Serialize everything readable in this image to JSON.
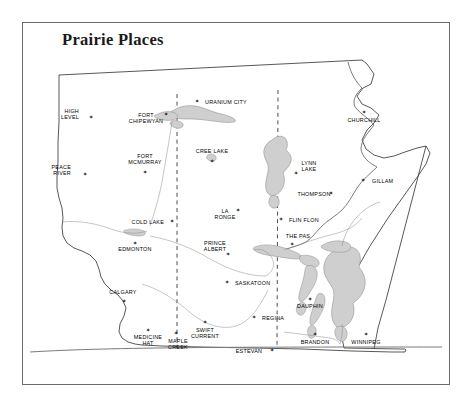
{
  "figure": {
    "title": "Prairie Places",
    "frame_color": "#6b6b6b",
    "background": "#ffffff",
    "land_fill": "#ffffff",
    "water_fill": "#cfcfcf",
    "water_stroke": "#8c8c8c",
    "border_stroke": "#3a3a3a",
    "province_border_style": "dashed",
    "marker_glyph": "✶"
  },
  "map": {
    "type": "reference-map",
    "region": "Canadian Prairie Provinces",
    "provinces": [
      "Alberta",
      "Saskatchewan",
      "Manitoba"
    ],
    "water_bodies": [
      "Lake Athabasca",
      "Reindeer Lake",
      "Lake Winnipeg",
      "Lake Winnipegosis",
      "Lake Manitoba",
      "Cedar Lake",
      "Lesser Slave Lake",
      "Cree Lake"
    ],
    "cities": [
      {
        "name": "HIGH\nLEVEL",
        "line1": "HIGH",
        "line2": "LEVEL",
        "x": 79,
        "y": 111,
        "mx": 91,
        "my": 117,
        "align": "left"
      },
      {
        "name": "PEACE\nRIVER",
        "line1": "PEACE",
        "line2": "RIVER",
        "x": 71,
        "y": 167,
        "mx": 85,
        "my": 174,
        "align": "left"
      },
      {
        "name": "FORT\nCHIPEWYAN",
        "line1": "FORT",
        "line2": "CHIPEWYAN",
        "x": 146,
        "y": 115,
        "mx": 166,
        "my": 114,
        "align": "center"
      },
      {
        "name": "FORT\nMCMURRAY",
        "line1": "FORT",
        "line2": "MCMURRAY",
        "x": 145,
        "y": 156,
        "mx": 145,
        "my": 172,
        "align": "center"
      },
      {
        "name": "URANIUM CITY",
        "line1": "URANIUM CITY",
        "line2": "",
        "x": 205,
        "y": 102,
        "mx": 197,
        "my": 101,
        "align": "right"
      },
      {
        "name": "CREE LAKE",
        "line1": "CREE LAKE",
        "line2": "",
        "x": 212,
        "y": 151,
        "mx": 212,
        "my": 161,
        "align": "center"
      },
      {
        "name": "COLD LAKE",
        "line1": "COLD LAKE",
        "line2": "",
        "x": 164,
        "y": 222,
        "mx": 172,
        "my": 221,
        "align": "left"
      },
      {
        "name": "EDMONTON",
        "line1": "EDMONTON",
        "line2": "",
        "x": 135,
        "y": 249,
        "mx": 135,
        "my": 243,
        "align": "center"
      },
      {
        "name": "CALGARY",
        "line1": "CALGARY",
        "line2": "",
        "x": 123,
        "y": 292,
        "mx": 124,
        "my": 301,
        "align": "center"
      },
      {
        "name": "MEDICINE\nHAT",
        "line1": "MEDICINE",
        "line2": "HAT",
        "x": 148,
        "y": 337,
        "mx": 148,
        "my": 330,
        "align": "center"
      },
      {
        "name": "MAPLE\nCREEK",
        "line1": "MAPLE",
        "line2": "CREEK",
        "x": 178,
        "y": 341,
        "mx": 176,
        "my": 333,
        "align": "center"
      },
      {
        "name": "LA\nRONGE",
        "line1": "LA",
        "line2": "RONGE",
        "x": 225,
        "y": 211,
        "mx": 238,
        "my": 210,
        "align": "center"
      },
      {
        "name": "PRINCE\nALBERT",
        "line1": "PRINCE",
        "line2": "ALBERT",
        "x": 215,
        "y": 243,
        "mx": 228,
        "my": 254,
        "align": "center"
      },
      {
        "name": "SASKATOON",
        "line1": "SASKATOON",
        "line2": "",
        "x": 235,
        "y": 283,
        "mx": 227,
        "my": 282,
        "align": "right"
      },
      {
        "name": "SWIFT\nCURRENT",
        "line1": "SWIFT",
        "line2": "CURRENT",
        "x": 205,
        "y": 330,
        "mx": 205,
        "my": 322,
        "align": "center"
      },
      {
        "name": "REGINA",
        "line1": "REGINA",
        "line2": "",
        "x": 262,
        "y": 318,
        "mx": 254,
        "my": 317,
        "align": "right"
      },
      {
        "name": "ESTEVAN",
        "line1": "ESTEVAN",
        "line2": "",
        "x": 249,
        "y": 351,
        "mx": 272,
        "my": 350,
        "align": "center"
      },
      {
        "name": "LYNN\nLAKE",
        "line1": "LYNN",
        "line2": "LAKE",
        "x": 309,
        "y": 163,
        "mx": 296,
        "my": 173,
        "align": "center"
      },
      {
        "name": "THOMPSON",
        "line1": "THOMPSON",
        "line2": "",
        "x": 314,
        "y": 194,
        "mx": 331,
        "my": 193,
        "align": "center"
      },
      {
        "name": "FLIN FLON",
        "line1": "FLIN FLON",
        "line2": "",
        "x": 289,
        "y": 220,
        "mx": 281,
        "my": 219,
        "align": "right"
      },
      {
        "name": "THE PAS",
        "line1": "THE PAS",
        "line2": "",
        "x": 298,
        "y": 236,
        "mx": 292,
        "my": 244,
        "align": "center"
      },
      {
        "name": "CHURCHILL",
        "line1": "CHURCHILL",
        "line2": "",
        "x": 364,
        "y": 120,
        "mx": 364,
        "my": 112,
        "align": "center"
      },
      {
        "name": "GILLAM",
        "line1": "GILLAM",
        "line2": "",
        "x": 372,
        "y": 181,
        "mx": 363,
        "my": 180,
        "align": "right"
      },
      {
        "name": "DAUPHIN",
        "line1": "DAUPHIN",
        "line2": "",
        "x": 310,
        "y": 306,
        "mx": 310,
        "my": 299,
        "align": "center"
      },
      {
        "name": "BRANDON",
        "line1": "BRANDON",
        "line2": "",
        "x": 315,
        "y": 342,
        "mx": 315,
        "my": 334,
        "align": "center"
      },
      {
        "name": "WINNIPEG",
        "line1": "WINNIPEG",
        "line2": "",
        "x": 366,
        "y": 342,
        "mx": 366,
        "my": 334,
        "align": "center"
      }
    ]
  }
}
